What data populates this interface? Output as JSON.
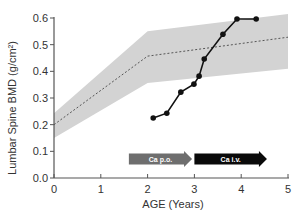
{
  "chart_data": {
    "type": "line",
    "title": "",
    "xlabel": "AGE (Years)",
    "ylabel": "Lumbar Spine BMD (g/cm²)",
    "xlim": [
      0,
      5
    ],
    "ylim": [
      0,
      0.6
    ],
    "xticks": [
      0,
      1,
      2,
      3,
      4,
      5
    ],
    "xtick_labels": [
      "0",
      "1",
      "2",
      "3",
      "4",
      "5"
    ],
    "yticks": [
      0.0,
      0.1,
      0.2,
      0.3,
      0.4,
      0.5,
      0.6
    ],
    "ytick_labels": [
      "0.0",
      "0.1",
      "0.2",
      "0.3",
      "0.4",
      "0.5",
      "0.6"
    ],
    "grid": false,
    "reference_band": {
      "name": "normal range",
      "color": "#d3d3d3",
      "x": [
        0,
        2,
        5
      ],
      "upper": [
        0.243,
        0.55,
        0.615
      ],
      "lower": [
        0.15,
        0.356,
        0.41
      ]
    },
    "reference_mean": {
      "name": "mean",
      "style": "dashed",
      "color": "#555555",
      "x": [
        0,
        2,
        5
      ],
      "y": [
        0.2,
        0.457,
        0.528
      ]
    },
    "series": [
      {
        "name": "patient",
        "color": "#111111",
        "marker": "circle",
        "x": [
          2.12,
          2.41,
          2.71,
          2.99,
          3.1,
          3.21,
          3.61,
          3.91,
          4.32
        ],
        "y": [
          0.225,
          0.243,
          0.322,
          0.352,
          0.382,
          0.446,
          0.539,
          0.596,
          0.596
        ]
      }
    ],
    "annotations": [
      {
        "label": "Ca p.o.",
        "type": "arrow",
        "x_start": 1.6,
        "x_end": 2.95,
        "color": "#6e6e6e",
        "text_color": "#ffffff"
      },
      {
        "label": "Ca i.v.",
        "type": "arrow",
        "x_start": 3.0,
        "x_end": 4.55,
        "color": "#0a0a0a",
        "text_color": "#ffffff"
      }
    ]
  }
}
